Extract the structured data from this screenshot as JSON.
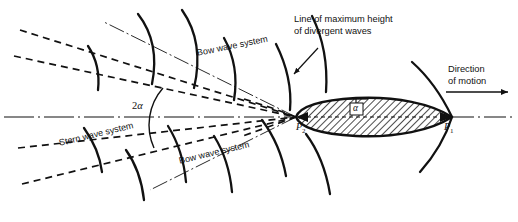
{
  "figure": {
    "type": "technical-line-diagram",
    "width": 518,
    "height": 222,
    "background_color": "#ffffff",
    "ink_color": "#111111"
  },
  "labels": {
    "bow_wave_upper": "Bow wave system",
    "bow_wave_lower": "Bow wave system",
    "stern_wave": "Stern wave system",
    "max_height_line_1": "Line of maximum height",
    "max_height_line_2": "of divergent waves",
    "direction_1": "Direction",
    "direction_2": "of motion",
    "angle_half": "α",
    "angle_full_prefix": "2",
    "angle_full_symbol": "α",
    "point_bow": "P",
    "point_bow_sub": "1",
    "point_stern": "P",
    "point_stern_sub": "2",
    "caption": ""
  },
  "elements": {
    "hull": {
      "name": "ship-hull",
      "fill": "hatched",
      "bow_x": 452,
      "stern_x": 296,
      "centerline_y": 117
    },
    "centerline": {
      "name": "ship-centerline",
      "style": "dash-dot",
      "y": 117
    },
    "cusp_ray_upper": {
      "name": "cusp-locus-upper",
      "style": "dash-dot"
    },
    "cusp_ray_lower": {
      "name": "cusp-locus-lower",
      "style": "dash-dot"
    },
    "divergent_envelope_count": 4,
    "wave_crest_count": 10
  },
  "colors": {
    "ink": "#111111",
    "paper": "#ffffff",
    "caption": "#8d8d8d"
  }
}
